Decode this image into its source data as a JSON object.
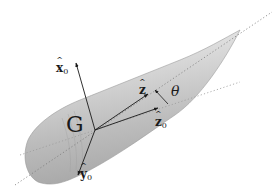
{
  "figure": {
    "body_color": "#cfcfcf",
    "axis_color": "#1a1a1a",
    "dotted_color": "#7a7a7a"
  },
  "labels": {
    "x0": {
      "base": "x",
      "sub": "0",
      "hat": true
    },
    "y0": {
      "base": "y",
      "sub": "0",
      "hat": true
    },
    "z0": {
      "base": "z",
      "sub": "0",
      "hat": true
    },
    "z": {
      "base": "z",
      "hat": true
    },
    "G": "G",
    "theta": "θ"
  },
  "geometry": {
    "center_G": [
      95,
      130
    ],
    "axis_x0_tip": [
      76,
      63
    ],
    "axis_y0_tip": [
      78,
      175
    ],
    "axis_z_tip": [
      148,
      94
    ],
    "axis_z0_tip": [
      158,
      108
    ],
    "body_axis_line": [
      [
        15,
        185
      ],
      [
        272,
        12
      ]
    ],
    "z0_dotted_line": [
      [
        20,
        155
      ],
      [
        240,
        82
      ]
    ],
    "nose_tip": [
      240,
      30
    ]
  }
}
